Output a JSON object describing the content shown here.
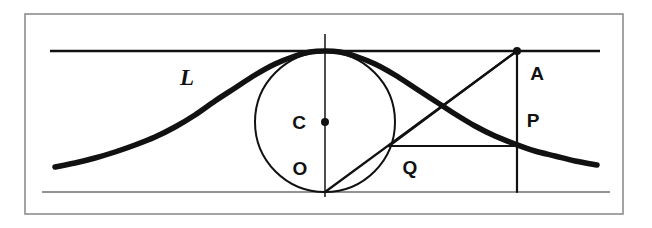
{
  "figure": {
    "kind": "geometry-diagram",
    "width": 652,
    "height": 228,
    "background_color": "#ffffff",
    "ink_color": "#111111",
    "thin_stroke_color": "#2b2b2b",
    "border_color": "#8d8d8d"
  },
  "labels": {
    "curve": "L",
    "center": "C",
    "origin": "O",
    "q_point": "Q",
    "a_point": "A",
    "p_point": "P"
  },
  "chart_data": {
    "type": "line",
    "xlabel": "",
    "ylabel": "",
    "grid": false,
    "legend": null,
    "axis_ranges": {
      "x_px": [
        25,
        623
      ],
      "y_px": [
        14,
        214
      ]
    },
    "annotations": [
      {
        "text": "L",
        "x_px": 187,
        "y_px": 77,
        "style": "italic-serif"
      },
      {
        "text": "C",
        "x_px": 299,
        "y_px": 122,
        "style": "bold-sans"
      },
      {
        "text": "O",
        "x_px": 300,
        "y_px": 168,
        "style": "bold-sans"
      },
      {
        "text": "Q",
        "x_px": 410,
        "y_px": 167,
        "style": "bold-sans"
      },
      {
        "text": "A",
        "x_px": 537,
        "y_px": 73,
        "style": "bold-sans"
      },
      {
        "text": "P",
        "x_px": 533,
        "y_px": 120,
        "style": "bold-sans"
      }
    ],
    "points": [
      {
        "name": "C",
        "x_px": 325,
        "y_px": 122,
        "marker": "filled-dot"
      },
      {
        "name": "A",
        "x_px": 517,
        "y_px": 51,
        "marker": "filled-dot"
      }
    ],
    "series": [
      {
        "name": "L",
        "role": "witch-of-agnesi-curve",
        "stroke_px": 5.5,
        "points_px": [
          [
            55,
            167
          ],
          [
            75,
            163
          ],
          [
            95,
            158
          ],
          [
            115,
            152
          ],
          [
            135,
            145
          ],
          [
            155,
            137
          ],
          [
            175,
            127
          ],
          [
            195,
            115
          ],
          [
            215,
            101
          ],
          [
            235,
            88
          ],
          [
            255,
            75
          ],
          [
            275,
            64
          ],
          [
            295,
            56
          ],
          [
            310,
            52
          ],
          [
            325,
            51
          ],
          [
            340,
            52
          ],
          [
            355,
            56
          ],
          [
            375,
            64
          ],
          [
            395,
            75
          ],
          [
            415,
            88
          ],
          [
            435,
            101
          ],
          [
            455,
            114
          ],
          [
            475,
            126
          ],
          [
            495,
            136
          ],
          [
            515,
            144
          ],
          [
            535,
            151
          ],
          [
            555,
            156
          ],
          [
            575,
            161
          ],
          [
            597,
            165
          ]
        ]
      }
    ],
    "shapes": [
      {
        "name": "outer-border",
        "type": "rect",
        "x_px": 25,
        "y_px": 14,
        "w_px": 598,
        "h_px": 200,
        "stroke_px": 1.6,
        "fill": "none"
      },
      {
        "name": "top-tangent-line",
        "type": "line",
        "x1_px": 50,
        "y1_px": 51,
        "x2_px": 600,
        "y2_px": 51,
        "stroke_px": 2.6
      },
      {
        "name": "bottom-base-line",
        "type": "line",
        "x1_px": 42,
        "y1_px": 192,
        "x2_px": 610,
        "y2_px": 192,
        "stroke_px": 1.5
      },
      {
        "name": "vertical-axis-line",
        "type": "line",
        "x1_px": 325,
        "y1_px": 34,
        "x2_px": 325,
        "y2_px": 197,
        "stroke_px": 1.8
      },
      {
        "name": "generating-circle",
        "type": "circle",
        "cx_px": 325,
        "cy_px": 122,
        "r_px": 70,
        "stroke_px": 2.0,
        "fill": "none"
      },
      {
        "name": "chord-O-to-A",
        "type": "line",
        "x1_px": 325,
        "y1_px": 192,
        "x2_px": 517,
        "y2_px": 51,
        "stroke_px": 2.2
      },
      {
        "name": "vertical-through-A",
        "type": "line",
        "x1_px": 517,
        "y1_px": 51,
        "x2_px": 517,
        "y2_px": 192,
        "stroke_px": 2.2
      },
      {
        "name": "horizontal-Q-to-P",
        "type": "line",
        "x1_px": 389,
        "y1_px": 146,
        "x2_px": 517,
        "y2_px": 146,
        "stroke_px": 2.2
      },
      {
        "name": "diagonal-A-to-Q",
        "type": "line",
        "x1_px": 517,
        "y1_px": 51,
        "x2_px": 389,
        "y2_px": 146,
        "stroke_px": 2.2
      }
    ]
  }
}
